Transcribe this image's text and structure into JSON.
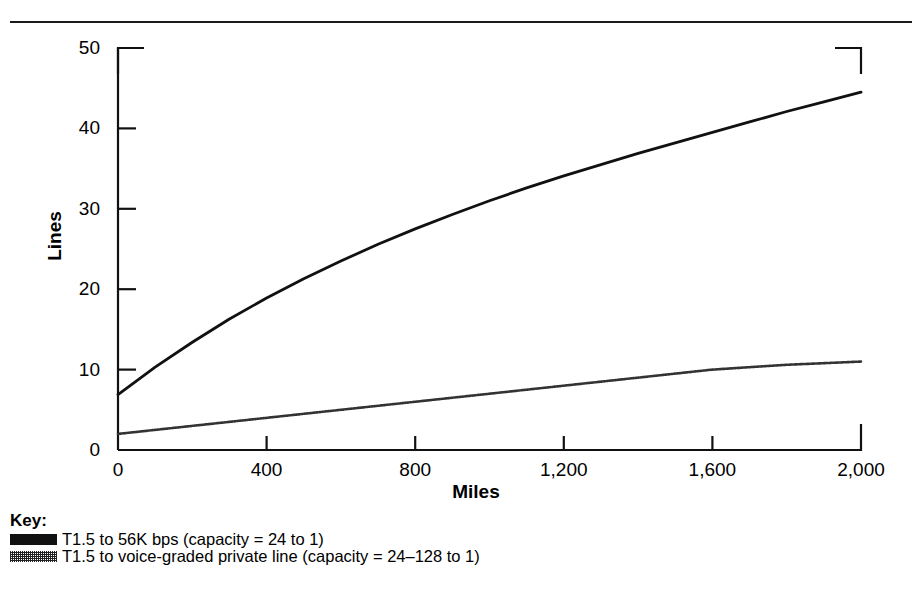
{
  "chart_data": {
    "type": "line",
    "title": "",
    "xlabel": "Miles",
    "ylabel": "Lines",
    "xlim": [
      0,
      2000
    ],
    "ylim": [
      0,
      50
    ],
    "grid": false,
    "legend_position": "below-left",
    "legend_title": "Key:",
    "xticks": [
      0,
      400,
      800,
      1200,
      1600,
      2000
    ],
    "xtick_labels": [
      "0",
      "400",
      "800",
      "1,200",
      "1,600",
      "2,000"
    ],
    "yticks": [
      0,
      10,
      20,
      30,
      40,
      50
    ],
    "ytick_labels": [
      "0",
      "10",
      "20",
      "30",
      "40",
      "50"
    ],
    "series": [
      {
        "name": "T1.5 to 56K bps (capacity = 24 to 1)",
        "style": "solid",
        "color": "#111111",
        "x": [
          0,
          100,
          200,
          300,
          400,
          500,
          600,
          700,
          800,
          900,
          1000,
          1100,
          1200,
          1300,
          1400,
          1500,
          1600,
          1700,
          1800,
          1900,
          2000
        ],
        "y": [
          6.9,
          10.3,
          13.4,
          16.3,
          18.9,
          21.3,
          23.5,
          25.6,
          27.5,
          29.3,
          31.0,
          32.6,
          34.1,
          35.5,
          36.9,
          38.2,
          39.5,
          40.8,
          42.1,
          43.3,
          44.5
        ]
      },
      {
        "name": "T1.5 to voice-graded private line (capacity = 24–128 to 1)",
        "style": "dotted",
        "color": "#333333",
        "x": [
          0,
          100,
          200,
          300,
          400,
          500,
          600,
          700,
          800,
          900,
          1000,
          1100,
          1200,
          1300,
          1400,
          1500,
          1600,
          1700,
          1800,
          1900,
          2000
        ],
        "y": [
          2.0,
          2.5,
          3.0,
          3.5,
          4.0,
          4.5,
          5.0,
          5.5,
          6.0,
          6.5,
          7.0,
          7.5,
          8.0,
          8.5,
          9.0,
          9.5,
          10.0,
          10.3,
          10.6,
          10.8,
          11.0
        ]
      }
    ]
  },
  "legend": {
    "title": "Key:",
    "entries": [
      {
        "swatch": "solid",
        "label": "T1.5 to 56K bps (capacity = 24 to 1)"
      },
      {
        "swatch": "dotted",
        "label": "T1.5 to voice-graded private line (capacity = 24–128 to 1)"
      }
    ]
  }
}
